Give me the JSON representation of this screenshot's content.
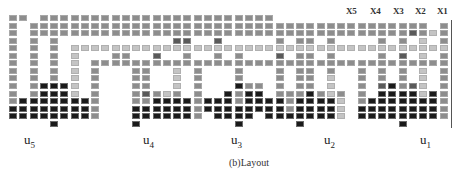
{
  "figure": {
    "caption": "(b)Layout",
    "column_labels": [
      "X5",
      "X4",
      "X3",
      "X2",
      "X1"
    ],
    "unit_labels": [
      {
        "base": "u",
        "sub": "5"
      },
      {
        "base": "u",
        "sub": "4"
      },
      {
        "base": "u",
        "sub": "3"
      },
      {
        "base": "u",
        "sub": "2"
      },
      {
        "base": "u",
        "sub": "1"
      }
    ],
    "legend_shades": {
      "l": "#c4c4c4",
      "m": "#8d8d8d",
      "d": "#5a5a5a",
      "k": "#1a1a1a"
    },
    "grid_rows": [
      "mm.mmmmmmmmmmmmmmmmmmmmmmm.................",
      "m.mmmmmmmmmmmmmmmmmmmmmmmmmmmmmmmmmmmmmmm.m",
      "m.mmmmmmmmmmmmmmmmmmmmmmmmmmmmmmmmmmmmmdmlm",
      "m.m.m...........dd..d.....m.mm.m....m.m.l.m",
      "m.m.m.lllllllllllllllllllllllllllllllllllll",
      "m.m.m.l...mm..d..m..m.m...d.mm.m....m.d.l.m",
      "m.m.m.l.mmmmmmmmmmmmmmmmmmmmmmmmmmmmmmmmmmm",
      "m.m.m.l.m...mm..l.m...m...m.mm.m..m.m.m.l.m",
      "m.m.m.l.m...mm..l.m...m...m.mm.l..m.m.m.l.m",
      "m.mkkkl.m...mm..l.m...kmm.m.mm.l..m.dkmdl.m",
      "m.mkkkl.m...mdmlm.m..kmkk.mmmkmlm.m.kkkklkm",
      "mkkkkkkkm...mmkkkkmkkkmkkkkmkkkkl.mkkkkkkkm",
      "kkkkkkkkm...kkkkkkmkkkkkkkkmkkkkl.kkkkkkkkm",
      "kkkkkkkkm...kkkkkkm.kkkk.kkkkkkkl.kkkkkkkkm",
      "....k.......k.........k.....k.........k...."
    ]
  }
}
